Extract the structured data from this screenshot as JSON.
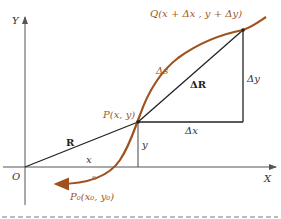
{
  "diagram": {
    "axes": {
      "x_label": "X",
      "y_label": "Y",
      "origin_label": "O"
    },
    "points": {
      "P": "P(x, y)",
      "Q": "Q(x + Δx , y + Δy)",
      "P0": "P₀(x₀, y₀)"
    },
    "labels": {
      "R": "R",
      "delta_R": "ΔR",
      "delta_s": "Δs",
      "delta_x": "Δx",
      "delta_y": "Δy",
      "x": "x",
      "y": "y",
      "s": "s"
    },
    "colors": {
      "curve": "#a0521e",
      "lines": "#222222",
      "axes": "#555555",
      "point_labels": "#9a5a2a"
    }
  }
}
